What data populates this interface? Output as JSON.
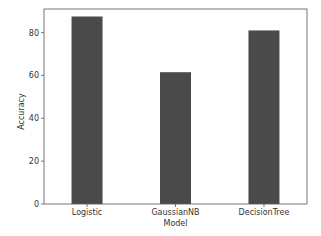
{
  "chart_data": {
    "type": "bar",
    "title": "",
    "xlabel": "Model",
    "ylabel": "Accuracy",
    "categories": [
      "Logistic",
      "GaussianNB",
      "DecisionTree"
    ],
    "values": [
      87.5,
      61.5,
      81.0
    ],
    "ylim": [
      0,
      91
    ],
    "yticks": [
      0,
      20,
      40,
      60,
      80
    ],
    "grid": false,
    "legend": null,
    "bar_color": "#4a4a4a"
  },
  "layout": {
    "plot": {
      "left": 44,
      "top": 9,
      "right": 307,
      "bottom": 204
    },
    "bar_width": 31
  }
}
